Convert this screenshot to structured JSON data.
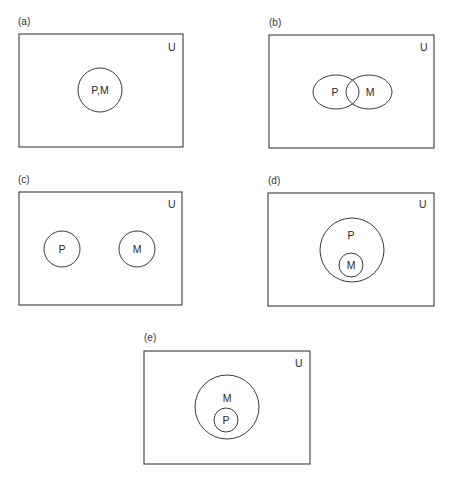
{
  "figure": {
    "panels": [
      {
        "id": "a",
        "label": "(a)",
        "universe_label": "U",
        "relation": "identical",
        "sets": [
          {
            "label": "P,M"
          }
        ]
      },
      {
        "id": "b",
        "label": "(b)",
        "universe_label": "U",
        "relation": "overlapping",
        "sets": [
          {
            "label": "P"
          },
          {
            "label": "M"
          }
        ]
      },
      {
        "id": "c",
        "label": "(c)",
        "universe_label": "U",
        "relation": "disjoint",
        "sets": [
          {
            "label": "P"
          },
          {
            "label": "M"
          }
        ]
      },
      {
        "id": "d",
        "label": "(d)",
        "universe_label": "U",
        "relation": "M subset of P",
        "sets": [
          {
            "label": "P"
          },
          {
            "label": "M"
          }
        ]
      },
      {
        "id": "e",
        "label": "(e)",
        "universe_label": "U",
        "relation": "P subset of M",
        "sets": [
          {
            "label": "M"
          },
          {
            "label": "P"
          }
        ]
      }
    ]
  }
}
